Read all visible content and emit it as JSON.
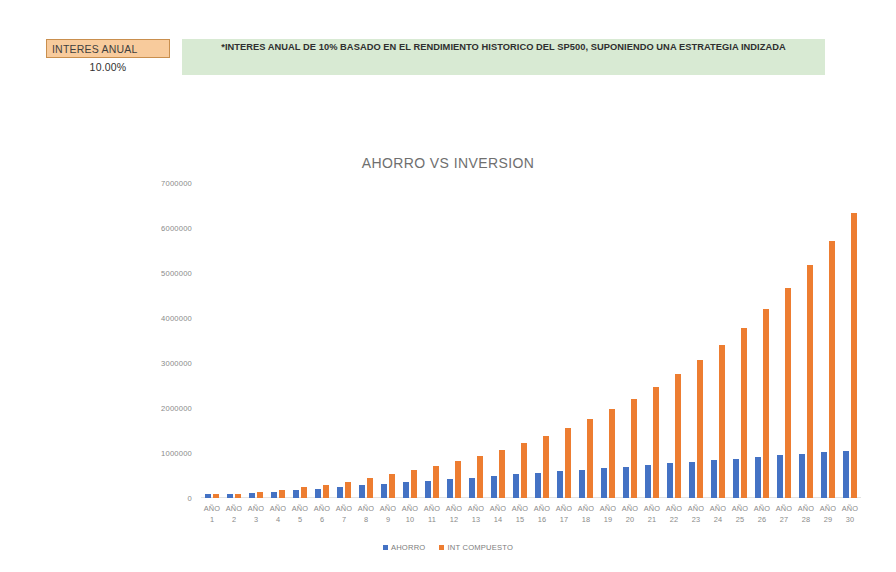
{
  "header": {
    "rate_label": "INTERES ANUAL",
    "rate_value": "10.00%",
    "note": "*INTERES ANUAL DE 10% BASADO EN EL RENDIMIENTO HISTORICO DEL SP500, SUPONIENDO UNA ESTRATEGIA INDIZADA",
    "label_bg": "#f8cb9c",
    "note_bg": "#d8ead3"
  },
  "chart_data": {
    "type": "bar",
    "title": "AHORRO VS INVERSION",
    "xlabel": "",
    "ylabel": "",
    "ylim": [
      0,
      7000000
    ],
    "ytick_labels": [
      "7000000",
      "6000000",
      "5000000",
      "4000000",
      "3000000",
      "2000000",
      "1000000",
      "0"
    ],
    "yticks": [
      7000000,
      6000000,
      5000000,
      4000000,
      3000000,
      2000000,
      1000000,
      0
    ],
    "grid": false,
    "legend_position": "bottom",
    "category_prefix": "AÑO",
    "categories": [
      "1",
      "2",
      "3",
      "4",
      "5",
      "6",
      "7",
      "8",
      "9",
      "10",
      "11",
      "12",
      "13",
      "14",
      "15",
      "16",
      "17",
      "18",
      "19",
      "20",
      "21",
      "22",
      "23",
      "24",
      "25",
      "26",
      "27",
      "28",
      "29",
      "30"
    ],
    "series": [
      {
        "name": "AHORRO",
        "color": "#4472c4",
        "values": [
          35000,
          70000,
          105000,
          140000,
          175000,
          210000,
          245000,
          280000,
          315000,
          350000,
          385000,
          420000,
          455000,
          490000,
          525000,
          560000,
          595000,
          630000,
          665000,
          700000,
          735000,
          770000,
          805000,
          840000,
          875000,
          910000,
          945000,
          980000,
          1015000,
          1050000
        ]
      },
      {
        "name": "INT COMPUESTO",
        "color": "#ed7d31",
        "values": [
          38500,
          80850,
          127435,
          178679,
          235046,
          297051,
          365256,
          440282,
          522810,
          613591,
          713450,
          823295,
          944124,
          1077037,
          1223240,
          1384064,
          1560971,
          1755568,
          1969625,
          2205087,
          2464096,
          2749006,
          3062406,
          3407147,
          3786362,
          4203498,
          4662348,
          5167083,
          5722291,
          6333020
        ]
      }
    ]
  },
  "legend": {
    "items": [
      {
        "label": "AHORRO",
        "color": "#4472c4"
      },
      {
        "label": "INT COMPUESTO",
        "color": "#ed7d31"
      }
    ]
  }
}
